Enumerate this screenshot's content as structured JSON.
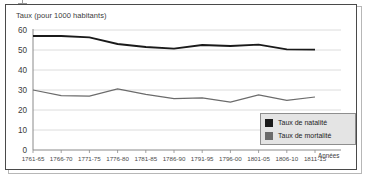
{
  "chart_data": {
    "type": "line",
    "title": "",
    "ylabel": "Taux (pour 1000 habitants)",
    "xlabel": "Années",
    "ylim": [
      0,
      60
    ],
    "yticks": [
      0,
      10,
      20,
      30,
      40,
      50,
      60
    ],
    "grid": true,
    "legend_position": "bottom-right",
    "categories": [
      "1761-65",
      "1766-70",
      "1771-75",
      "1776-80",
      "1781-85",
      "1786-90",
      "1791-95",
      "1796-00",
      "1801-05",
      "1806-10",
      "1811-15"
    ],
    "series": [
      {
        "name": "Taux de natalité",
        "color": "#1a1a1a",
        "values": [
          57.0,
          57.0,
          56.3,
          53.0,
          51.5,
          50.7,
          52.5,
          52.0,
          52.7,
          50.3,
          50.2
        ]
      },
      {
        "name": "Taux de mortalité",
        "color": "#6b6b6b",
        "values": [
          30.0,
          27.2,
          27.0,
          30.5,
          27.8,
          25.7,
          26.0,
          24.0,
          27.6,
          24.8,
          26.5
        ]
      }
    ]
  },
  "legend": {
    "entries": [
      {
        "label": "Taux de natalité",
        "color": "#1a1a1a"
      },
      {
        "label": "Taux de mortalité",
        "color": "#6b6b6b"
      }
    ]
  }
}
